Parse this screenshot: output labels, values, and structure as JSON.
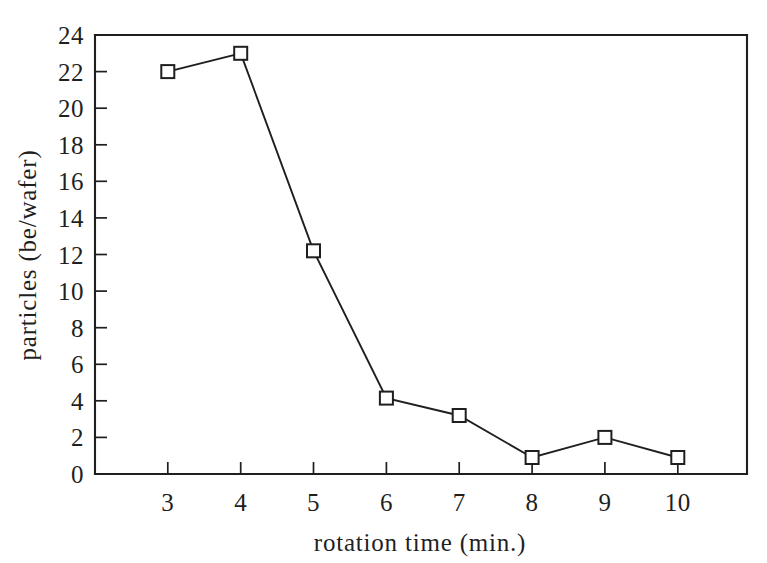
{
  "chart_data": {
    "type": "line",
    "title": "",
    "subtitle": "",
    "xlabel": "rotation time (min.)",
    "ylabel": "particles (be/wafer)",
    "x": [
      3,
      4,
      5,
      6,
      7,
      8,
      9,
      10
    ],
    "values": [
      22.0,
      23.0,
      12.2,
      4.15,
      3.2,
      0.9,
      2.0,
      0.9
    ],
    "series": [
      {
        "name": "particles",
        "x": [
          3,
          4,
          5,
          6,
          7,
          8,
          9,
          10
        ],
        "values": [
          22.0,
          23.0,
          12.2,
          4.15,
          3.2,
          0.9,
          2.0,
          0.9
        ],
        "marker": "open-square",
        "color": "#1f1f1f"
      }
    ],
    "xlim": [
      2.0,
      10.95
    ],
    "ylim": [
      0,
      24
    ],
    "xticks": [
      3,
      4,
      5,
      6,
      7,
      8,
      9,
      10
    ],
    "xtick_labels": [
      "3",
      "4",
      "5",
      "6",
      "7",
      "8",
      "9",
      "10"
    ],
    "yticks": [
      0,
      2,
      4,
      6,
      8,
      10,
      12,
      14,
      16,
      18,
      20,
      22,
      24
    ],
    "ytick_labels": [
      "0",
      "2",
      "4",
      "6",
      "8",
      "10",
      "12",
      "14",
      "16",
      "18",
      "20",
      "22",
      "24"
    ],
    "grid": false,
    "legend": false,
    "legend_position": "none",
    "annotations": [],
    "background_color": "#ffffff",
    "line_color": "#1f1f1f",
    "marker_fill": "#ffffff"
  },
  "figure": {
    "caption_fragment": ""
  }
}
